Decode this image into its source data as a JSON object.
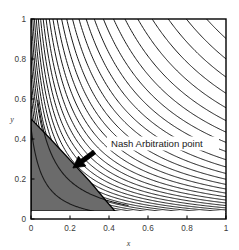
{
  "figure": {
    "name": "nash-arbitration-contour-plot",
    "background": "#ffffff",
    "plot_area": {
      "left": 31,
      "top": 19,
      "right": 226,
      "bottom": 219
    }
  },
  "annotation": {
    "label": "Nash Arbitration point",
    "label_x": 0.4,
    "label_y": 0.36,
    "arrow_tip_x": 0.215,
    "arrow_tip_y": 0.255,
    "arrow_tail_x": 0.325,
    "arrow_tail_y": 0.335,
    "text_color": "#1a1a1a",
    "arrow_color": "#000000",
    "box_color": "#ffffff"
  },
  "colors": {
    "axis": "#000000",
    "contour": "#1a1a1a",
    "feasible_fill": "#6b6b6b",
    "feasible_fill_dark": "#575757",
    "tick_label": "#3a3a3a",
    "plot_background": "#ffffff"
  },
  "chart_data": {
    "type": "line",
    "title": "",
    "subtitle": "",
    "xlabel": "x",
    "ylabel": "y",
    "xlim": [
      0,
      1
    ],
    "ylim": [
      0,
      1
    ],
    "grid": false,
    "legend": null,
    "x_ticks": [
      0,
      0.2,
      0.4,
      0.6,
      0.8,
      1
    ],
    "x_tick_labels": [
      "0",
      "0.2",
      "0.4",
      "0.6",
      "0.8",
      "1"
    ],
    "y_ticks": [
      0,
      0.2,
      0.4,
      0.6,
      0.8,
      1
    ],
    "y_tick_labels": [
      "0",
      "0.2",
      "0.4",
      "0.6",
      "0.8",
      "1"
    ],
    "contours": {
      "family": "hyperbola",
      "form": "(x + a) * (y + b) = k",
      "a": 0.06,
      "b": 0.04,
      "count": 46,
      "k_min": 0.0065,
      "k_max": 1.12,
      "k_spacing": "geometric",
      "line_width": 1.0,
      "color": "#1a1a1a"
    },
    "feasible_region": {
      "label": "feasible bargaining set",
      "fill": "#6b6b6b",
      "vertices": [
        [
          0.0,
          0.04
        ],
        [
          0.0,
          0.5
        ],
        [
          0.1,
          0.4
        ],
        [
          0.2,
          0.295
        ],
        [
          0.3,
          0.19
        ],
        [
          0.39,
          0.085
        ],
        [
          0.43,
          0.04
        ]
      ],
      "boundary_color": "#000000",
      "inner_contours": [
        {
          "k": 0.03,
          "color": "#1a1a1a"
        },
        {
          "k": 0.06,
          "color": "#1a1a1a"
        }
      ]
    },
    "baseline_band": {
      "note": "white strip below y = 0.04 inside the axes",
      "y_top": 0.04,
      "y_bottom": 0.0,
      "fill": "#ffffff"
    },
    "nash_point": {
      "x": 0.205,
      "y": 0.29,
      "label": "Nash Arbitration point"
    }
  }
}
